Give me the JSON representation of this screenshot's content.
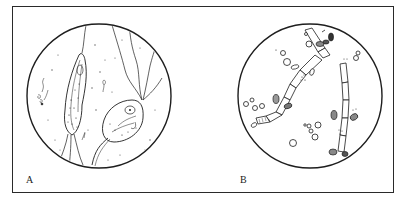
{
  "figure": {
    "panels": [
      {
        "label": "A",
        "subject": "protozoa-flagellates",
        "description": "Microscopic field showing two flagellated protozoa (trichomonad-like) with undulating flagella and scattered small particles",
        "circle": {
          "cx": 99,
          "cy": 96,
          "r": 72
        }
      },
      {
        "label": "B",
        "subject": "fungal-hyphae-and-spores",
        "description": "Microscopic field showing segmented fungal pseudohyphae with budding oval yeast cells/spores (Candida-like) and scattered round cells",
        "circle": {
          "cx": 310,
          "cy": 96,
          "r": 72
        }
      }
    ]
  },
  "colors": {
    "ink": "#1e1e1e",
    "frame": "#2a2a2a",
    "background": "#ffffff"
  }
}
